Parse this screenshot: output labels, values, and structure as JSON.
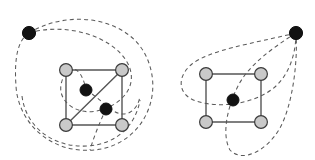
{
  "figure": {
    "background_color": "#ffffff",
    "width": 315,
    "height": 160,
    "colors": {
      "solid_edge": "#555555",
      "dashed_edge": "#5a5a5a",
      "gray_node_fill": "#c9c9c9",
      "gray_node_stroke": "#3a3a3a",
      "black_node_fill": "#121212"
    },
    "panels": [
      {
        "id": "left-panel",
        "name": "left-graph",
        "nodes": [
          {
            "id": "L-outer",
            "type": "black",
            "cx": 29,
            "cy": 33,
            "r": 6.6
          },
          {
            "id": "L-tl",
            "type": "gray",
            "cx": 66,
            "cy": 70,
            "r": 6.4
          },
          {
            "id": "L-tr",
            "type": "gray",
            "cx": 122,
            "cy": 70,
            "r": 6.4
          },
          {
            "id": "L-bl",
            "type": "gray",
            "cx": 66,
            "cy": 125,
            "r": 6.4
          },
          {
            "id": "L-br",
            "type": "gray",
            "cx": 122,
            "cy": 125,
            "r": 6.4
          },
          {
            "id": "L-in1",
            "type": "black",
            "cx": 86,
            "cy": 90,
            "r": 6.0
          },
          {
            "id": "L-in2",
            "type": "black",
            "cx": 106,
            "cy": 109,
            "r": 6.0
          }
        ],
        "solid_edges": [
          {
            "from": "L-tl",
            "to": "L-tr"
          },
          {
            "from": "L-tr",
            "to": "L-br"
          },
          {
            "from": "L-br",
            "to": "L-bl"
          },
          {
            "from": "L-bl",
            "to": "L-tl"
          },
          {
            "from": "L-bl",
            "to": "L-tr"
          }
        ],
        "dashed_loops": [
          {
            "id": "L-loop-outer",
            "description": "large dashed ellipse through the outer black node enclosing the square",
            "path": "M 29 33 C 70 8 128 18 146 56 C 166 98 140 146 94 150 C 50 154 18 122 16 86 C 14 57 18 40 29 33 Z"
          },
          {
            "id": "L-loop-inner",
            "description": "smaller dashed ellipse from outer black node through the two interior black nodes",
            "path": "M 29 33 C 66 22 112 36 127 62 C 140 85 122 104 101 110 C 78 117 58 102 61 85 C 64 67 80 59 86 90"
          },
          {
            "id": "L-loop-inner-b",
            "description": "dashed arc continuing from interior node toward lower right and around",
            "path": "M 86 90 C 96 96 104 104 112 110 C 126 120 138 110 140 96"
          },
          {
            "id": "L-loop-bottom",
            "description": "dashed arc sweeping under the square from left to right",
            "path": "M 22 96 C 26 128 54 148 88 146 C 118 144 136 124 140 100"
          },
          {
            "id": "L-loop-diag",
            "description": "dashed curve descending from interior black node through the bottom edge",
            "path": "M 106 109 C 100 122 94 136 90 150"
          }
        ]
      },
      {
        "id": "right-panel",
        "name": "right-graph",
        "nodes": [
          {
            "id": "R-outer",
            "type": "black",
            "cx": 296,
            "cy": 33,
            "r": 6.6
          },
          {
            "id": "R-tl",
            "type": "gray",
            "cx": 206,
            "cy": 74,
            "r": 6.4
          },
          {
            "id": "R-tr",
            "type": "gray",
            "cx": 261,
            "cy": 74,
            "r": 6.4
          },
          {
            "id": "R-bl",
            "type": "gray",
            "cx": 206,
            "cy": 122,
            "r": 6.4
          },
          {
            "id": "R-br",
            "type": "gray",
            "cx": 261,
            "cy": 122,
            "r": 6.4
          },
          {
            "id": "R-center",
            "type": "black",
            "cx": 233,
            "cy": 100,
            "r": 6.0
          }
        ],
        "solid_edges": [
          {
            "from": "R-tl",
            "to": "R-tr"
          },
          {
            "from": "R-tr",
            "to": "R-br"
          },
          {
            "from": "R-br",
            "to": "R-bl"
          },
          {
            "from": "R-bl",
            "to": "R-tl"
          }
        ],
        "dashed_loops": [
          {
            "id": "R-loop-horizontal",
            "description": "horizontal teardrop loop from the outer black node around the left of the square through the center node",
            "path": "M 296 33 C 250 44 210 50 192 64 C 176 77 178 95 196 101 C 220 109 256 104 276 86 C 290 73 296 52 296 33 Z"
          },
          {
            "id": "R-loop-vertical",
            "description": "vertical teardrop loop from the outer black node down around the bottom of the square through the center node",
            "path": "M 296 33 C 272 48 248 66 238 86 C 226 110 222 136 230 150 C 242 163 266 152 280 128 C 292 106 298 64 296 33 Z"
          }
        ]
      }
    ]
  }
}
